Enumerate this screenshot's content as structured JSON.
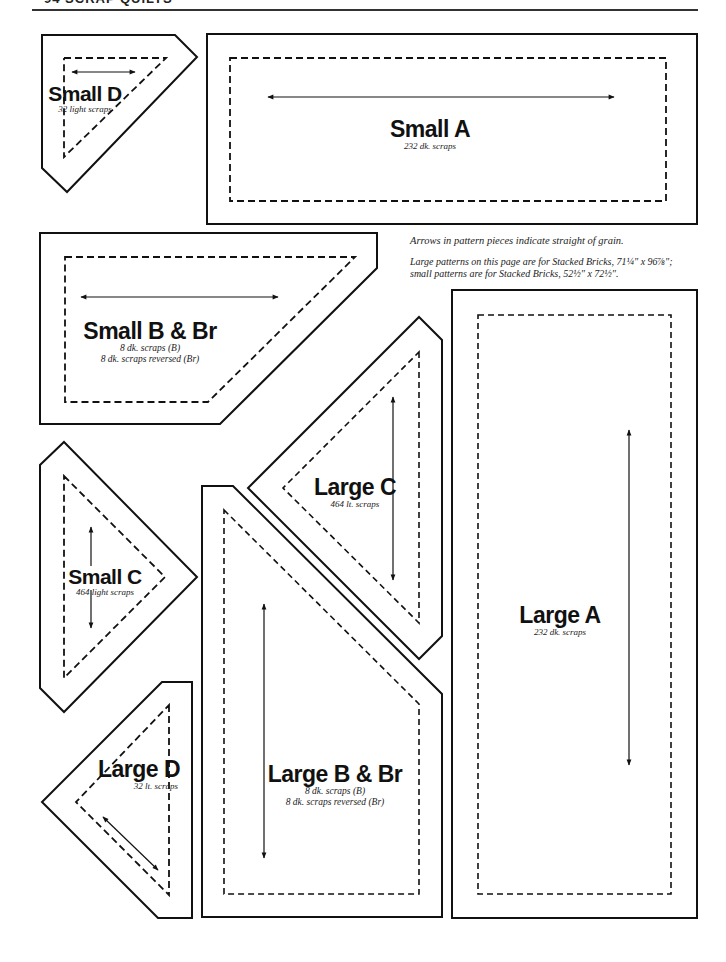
{
  "page": {
    "header": "94 SCRAP QUILTS",
    "notes": {
      "grain": "Arrows in pattern pieces indicate straight of grain.",
      "sizes_line1": "Large patterns on this page are for Stacked Bricks, 71¼\" x 96⅞\";",
      "sizes_line2": "small patterns are for Stacked Bricks, 52½\" x 72½\"."
    }
  },
  "pieces": {
    "small_d": {
      "name": "Small D",
      "qty": "32 light scraps"
    },
    "small_a": {
      "name": "Small A",
      "qty": "232 dk. scraps"
    },
    "small_b": {
      "name": "Small B & Br",
      "qty": "8 dk. scraps (B)",
      "qty2": "8 dk. scraps reversed (Br)"
    },
    "small_c": {
      "name": "Small C",
      "qty": "464 light scraps"
    },
    "large_c": {
      "name": "Large C",
      "qty": "464 lt. scraps"
    },
    "large_a": {
      "name": "Large A",
      "qty": "232 dk. scraps"
    },
    "large_d": {
      "name": "Large D",
      "qty": "32 lt. scraps"
    },
    "large_b": {
      "name": "Large B & Br",
      "qty": "8 dk. scraps (B)",
      "qty2": "8 dk. scraps reversed (Br)"
    }
  },
  "colors": {
    "ink": "#111111",
    "paper": "#ffffff"
  }
}
